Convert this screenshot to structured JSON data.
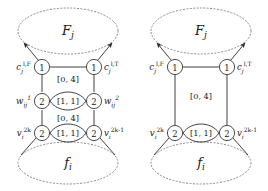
{
  "figure": {
    "title": "",
    "background": "#ffffff",
    "ink": "#2b2b2b",
    "dotted_ink": "#8a8a8a",
    "panels": [
      {
        "id": "left-panel",
        "top_set_label": "F",
        "top_set_sub": "j",
        "bottom_set_label": "f",
        "bottom_set_sub": "i",
        "nodes": [
          {
            "id": "c-false",
            "value": "1",
            "label_base": "c",
            "label_sub": "j",
            "label_sup": "l,F",
            "side": "left",
            "row": "top"
          },
          {
            "id": "c-true",
            "value": "1",
            "label_base": "c",
            "label_sub": "j",
            "label_sup": "l,T",
            "side": "right",
            "row": "top"
          },
          {
            "id": "w-one",
            "value": "2",
            "label_base": "w",
            "label_sub": "ij",
            "label_sup": "1",
            "side": "left",
            "row": "middle"
          },
          {
            "id": "w-two",
            "value": "2",
            "label_base": "w",
            "label_sub": "ij",
            "label_sup": "2",
            "side": "right",
            "row": "middle"
          },
          {
            "id": "v-even",
            "value": "2",
            "label_base": "v",
            "label_sub": "i",
            "label_sup": "2k",
            "side": "left",
            "row": "bottom"
          },
          {
            "id": "v-odd",
            "value": "2",
            "label_base": "v",
            "label_sub": "i",
            "label_sup": "2k-1",
            "side": "right",
            "row": "bottom"
          }
        ],
        "edge_labels": [
          "[0, 4]",
          "[1, 1]",
          "[0, 4]",
          "[1, 1]"
        ]
      },
      {
        "id": "right-panel",
        "top_set_label": "F",
        "top_set_sub": "j",
        "bottom_set_label": "f",
        "bottom_set_sub": "i",
        "nodes": [
          {
            "id": "c-false",
            "value": "1",
            "label_base": "c",
            "label_sub": "j",
            "label_sup": "l,F",
            "side": "left",
            "row": "top"
          },
          {
            "id": "c-true",
            "value": "1",
            "label_base": "c",
            "label_sub": "j",
            "label_sup": "l,T",
            "side": "right",
            "row": "top"
          },
          {
            "id": "v-even",
            "value": "2",
            "label_base": "v",
            "label_sub": "i",
            "label_sup": "2k",
            "side": "left",
            "row": "bottom"
          },
          {
            "id": "v-odd",
            "value": "2",
            "label_base": "v",
            "label_sub": "i",
            "label_sup": "2k-1",
            "side": "right",
            "row": "bottom"
          }
        ],
        "edge_labels": [
          "[0, 4]",
          "[1, 1]"
        ]
      }
    ]
  }
}
